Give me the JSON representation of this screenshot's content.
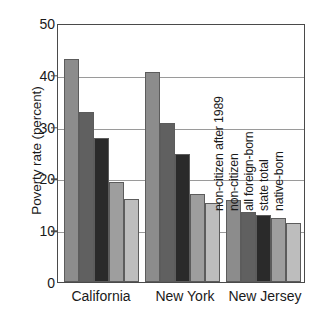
{
  "chart_data": {
    "type": "bar",
    "title": "",
    "subtitle": "",
    "xlabel": "",
    "ylabel": "Poverty rate (percent)",
    "ylim": [
      0,
      50
    ],
    "yticks": [
      0,
      10,
      20,
      30,
      40,
      50
    ],
    "ytick_labels": [
      "0",
      "10",
      "20",
      "30",
      "40",
      "50"
    ],
    "grid": true,
    "legend_position": "inline-rotated-annotations",
    "categories": [
      "California",
      "New York",
      "New Jersey"
    ],
    "series": [
      {
        "name": "non-citizen after 1989",
        "color": "#8c8c8c",
        "values": [
          43.0,
          40.5,
          15.9
        ]
      },
      {
        "name": "non-citizen",
        "color": "#606060",
        "values": [
          32.9,
          30.7,
          13.5
        ]
      },
      {
        "name": "all foreign-born",
        "color": "#2a2a2a",
        "values": [
          27.8,
          24.7,
          13.0
        ]
      },
      {
        "name": "state total",
        "color": "#9e9e9e",
        "values": [
          19.3,
          16.9,
          12.4
        ]
      },
      {
        "name": "native-born",
        "color": "#bdbdbd",
        "values": [
          16.0,
          15.3,
          11.4
        ]
      }
    ],
    "annotations": [
      "non-citizen after 1989",
      "non-citizen",
      "all foreign-born",
      "state total",
      "native-born"
    ]
  },
  "axis": {
    "y_title": "Poverty rate (percent)",
    "tick_0": "0",
    "tick_10": "10",
    "tick_20": "20",
    "tick_30": "30",
    "tick_40": "40",
    "tick_50": "50"
  },
  "groups": {
    "g0": "California",
    "g1": "New York",
    "g2": "New Jersey"
  },
  "annotations": {
    "a0": "non-citizen after 1989",
    "a1": "non-citizen",
    "a2": "all foreign-born",
    "a3": "state total",
    "a4": "native-born"
  }
}
